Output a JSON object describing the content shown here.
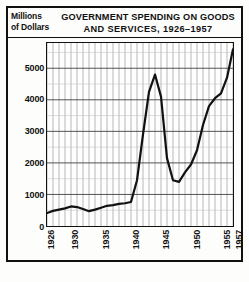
{
  "figure": {
    "units_line1": "Millions",
    "units_line2": "of Dollars",
    "title_line1": "GOVERNMENT SPENDING ON GOODS",
    "title_line2": "AND SERVICES, 1926–1957"
  },
  "chart_data": {
    "type": "line",
    "subtitle": "",
    "xlabel": "",
    "ylabel": "Millions of Dollars",
    "xlim": [
      1926,
      1957
    ],
    "ylim": [
      0,
      5800
    ],
    "grid": true,
    "legend": null,
    "y_ticks": [
      0,
      1000,
      2000,
      3000,
      4000,
      5000
    ],
    "y_tick_labels": [
      "0",
      "1000",
      "2000",
      "3000",
      "4000",
      "5000"
    ],
    "x_ticks": [
      1926,
      1930,
      1935,
      1940,
      1945,
      1950,
      1955,
      1957
    ],
    "x_tick_labels": [
      "1926",
      "1930",
      "1935",
      "1940",
      "1945",
      "1950",
      "1955",
      "1957"
    ],
    "x_minor_gridlines": true,
    "y_minor_gridlines": false,
    "line_color": "#111111",
    "line_width": 2.2,
    "x": [
      1926,
      1927,
      1928,
      1929,
      1930,
      1931,
      1932,
      1933,
      1934,
      1935,
      1936,
      1937,
      1938,
      1939,
      1940,
      1941,
      1942,
      1943,
      1944,
      1945,
      1946,
      1947,
      1948,
      1949,
      1950,
      1951,
      1952,
      1953,
      1954,
      1955,
      1956,
      1957
    ],
    "values": [
      410,
      480,
      520,
      560,
      620,
      600,
      540,
      470,
      520,
      580,
      640,
      660,
      700,
      720,
      760,
      1450,
      2900,
      4250,
      4800,
      4100,
      2150,
      1450,
      1400,
      1700,
      1950,
      2400,
      3200,
      3800,
      4050,
      4200,
      4700,
      5600
    ],
    "annotations": [
      {
        "label": "World War II peak",
        "x": 1944,
        "y": 4800
      },
      {
        "label": "Post-war trough",
        "x": 1948,
        "y": 1400
      }
    ]
  },
  "y_axis": {
    "ticks": [
      {
        "label": "5000",
        "value": 5000
      },
      {
        "label": "4000",
        "value": 4000
      },
      {
        "label": "3000",
        "value": 3000
      },
      {
        "label": "2000",
        "value": 2000
      },
      {
        "label": "1000",
        "value": 1000
      },
      {
        "label": "0",
        "value": 0
      }
    ]
  },
  "x_axis": {
    "ticks": [
      {
        "label": "1926",
        "value": 1926
      },
      {
        "label": "1930",
        "value": 1930
      },
      {
        "label": "1935",
        "value": 1935
      },
      {
        "label": "1940",
        "value": 1940
      },
      {
        "label": "1945",
        "value": 1945
      },
      {
        "label": "1950",
        "value": 1950
      },
      {
        "label": "1955",
        "value": 1955
      },
      {
        "label": "1957",
        "value": 1957
      }
    ]
  }
}
